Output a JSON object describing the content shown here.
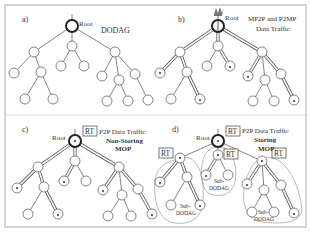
{
  "figure": {
    "panels": [
      {
        "id": "a",
        "label": "a)",
        "root_label": "Root",
        "caption_lines": [
          "DODAG"
        ]
      },
      {
        "id": "b",
        "label": "b)",
        "root_label": "Root",
        "caption_lines": [
          "MP2P and P2MP",
          "Data Traffic"
        ]
      },
      {
        "id": "c",
        "label": "c)",
        "root_label": "Root",
        "rt_label": "RT",
        "caption_lines": [
          "P2P Data Traffic",
          "Non-Storing",
          "MOP"
        ]
      },
      {
        "id": "d",
        "label": "d)",
        "root_label": "Root",
        "rt_label": "RT",
        "caption_lines": [
          "P2P Data Traffic",
          "Storing",
          "MOP"
        ],
        "sub_dodag_lines": [
          "Sub-",
          "DODAG"
        ]
      }
    ]
  }
}
